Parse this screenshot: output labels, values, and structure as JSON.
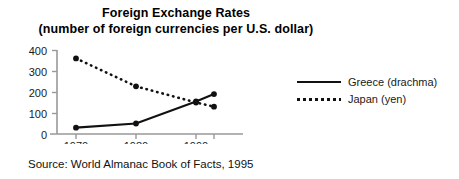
{
  "title": {
    "line1": "Foreign Exchange Rates",
    "line2": "(number of foreign currencies per U.S. dollar)"
  },
  "source": "Source: World Almanac Book of Facts, 1995",
  "legend": {
    "items": [
      {
        "label": "Greece (drachma)",
        "style": "solid",
        "color": "#111111"
      },
      {
        "label": "Japan (yen)",
        "style": "dotted",
        "color": "#111111"
      }
    ]
  },
  "axis": {
    "y_ticks": [
      "0",
      "100",
      "200",
      "300",
      "400"
    ],
    "x_ticks": [
      "1970",
      "1980",
      "1990"
    ],
    "x_extra_tick": "1993"
  },
  "chart_data": {
    "type": "line",
    "title": "Foreign Exchange Rates (number of foreign currencies per U.S. dollar)",
    "xlabel": "",
    "ylabel": "",
    "x": [
      1970,
      1980,
      1990,
      1993
    ],
    "xlim": [
      1965,
      1996
    ],
    "ylim": [
      0,
      400
    ],
    "ytick_values": [
      0,
      100,
      200,
      300,
      400
    ],
    "xtick_values": [
      1970,
      1980,
      1990,
      1993
    ],
    "grid": false,
    "legend_position": "right",
    "series": [
      {
        "name": "Greece (drachma)",
        "style": "solid",
        "color": "#111111",
        "values": [
          30,
          50,
          155,
          190
        ]
      },
      {
        "name": "Japan (yen)",
        "style": "dotted",
        "color": "#111111",
        "values": [
          360,
          227,
          150,
          130
        ]
      }
    ]
  }
}
